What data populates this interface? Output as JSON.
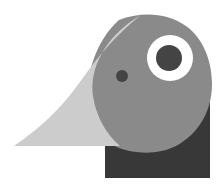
{
  "artwork": {
    "name": "toucan-bird-head-logo",
    "kind": "flat-geometric-logo",
    "subject": "toucan bird head in profile facing left",
    "width": 223,
    "height": 187,
    "background_color": "#ffffff",
    "palette": {
      "beak": "#cccccc",
      "head": "#8a8a8a",
      "body": "#383838",
      "eye_ring": "#ffffff",
      "pupil": "#444444",
      "nostril": "#444444",
      "background": "#ffffff"
    },
    "shapes": [
      {
        "name": "body",
        "label": "Body",
        "color": "#383838",
        "description": "dark rectangle at lower right with curved concave top-left edge",
        "path": "M105,143 L105,178 L210,178 L210,96 C210,96 196,130 166,143 C146,151 122,146 105,143 Z"
      },
      {
        "name": "head",
        "label": "Head",
        "color": "#8a8a8a",
        "description": "medium gray rounded head dome",
        "path": "M119,20 C140,12 166,12 186,26 C204,39 212,62 212,84 C212,112 198,134 176,146 C158,155 136,154 119,148 C101,141 90,124 88,104 C85,76 96,40 119,20 Z"
      },
      {
        "name": "beak",
        "label": "Beak",
        "color": "#cccccc",
        "description": "large light gray curved wedge pointing left",
        "path": "M141,15 C118,33 98,56 80,82 C60,110 40,128 14,146 L120,146 C106,134 96,116 93,96 C89,68 106,35 141,15 Z"
      },
      {
        "name": "eye-ring",
        "label": "Eye ring",
        "color": "#ffffff",
        "cx": 170,
        "cy": 58,
        "r": 23
      },
      {
        "name": "pupil",
        "label": "Pupil",
        "color": "#444444",
        "cx": 169,
        "cy": 58,
        "r": 13
      },
      {
        "name": "nostril",
        "label": "Nostril",
        "color": "#444444",
        "cx": 122,
        "cy": 76,
        "r": 6
      }
    ]
  }
}
